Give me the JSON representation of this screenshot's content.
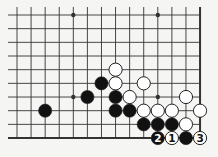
{
  "diagram": {
    "type": "go-board-fragment",
    "grid": {
      "columns": 14,
      "rows": 10,
      "x0": 17,
      "y0": 15,
      "dx": 14.08,
      "dy": 13.67,
      "open_left": true,
      "open_top": true,
      "edge_right": true,
      "edge_bottom": true
    },
    "colors": {
      "background": "#f5f5f3",
      "line": "#333333",
      "black_stone": "#111111",
      "white_stone": "#ffffff",
      "stone_outline": "#222222"
    },
    "star_points": [
      {
        "col": 4,
        "row": 0
      },
      {
        "col": 10,
        "row": 0
      },
      {
        "col": 4,
        "row": 6
      },
      {
        "col": 10,
        "row": 6
      }
    ],
    "stones": [
      {
        "color": "black",
        "col": 2,
        "row": 7,
        "label": ""
      },
      {
        "color": "black",
        "col": 5,
        "row": 6,
        "label": ""
      },
      {
        "color": "black",
        "col": 6,
        "row": 5,
        "label": ""
      },
      {
        "color": "white",
        "col": 7,
        "row": 4,
        "label": ""
      },
      {
        "color": "white",
        "col": 7,
        "row": 5,
        "label": ""
      },
      {
        "color": "white",
        "col": 9,
        "row": 5,
        "label": ""
      },
      {
        "color": "black",
        "col": 7,
        "row": 6,
        "label": ""
      },
      {
        "color": "white",
        "col": 8,
        "row": 6,
        "label": ""
      },
      {
        "color": "white",
        "col": 12,
        "row": 6,
        "label": ""
      },
      {
        "color": "black",
        "col": 7,
        "row": 7,
        "label": ""
      },
      {
        "color": "black",
        "col": 8,
        "row": 7,
        "label": ""
      },
      {
        "color": "white",
        "col": 9,
        "row": 7,
        "label": ""
      },
      {
        "color": "white",
        "col": 10,
        "row": 7,
        "label": ""
      },
      {
        "color": "white",
        "col": 11,
        "row": 7,
        "label": ""
      },
      {
        "color": "white",
        "col": 13,
        "row": 7,
        "label": ""
      },
      {
        "color": "black",
        "col": 9,
        "row": 8,
        "label": ""
      },
      {
        "color": "black",
        "col": 10,
        "row": 8,
        "label": ""
      },
      {
        "color": "black",
        "col": 11,
        "row": 8,
        "label": ""
      },
      {
        "color": "white",
        "col": 12,
        "row": 8,
        "label": ""
      },
      {
        "color": "black",
        "col": 10,
        "row": 9,
        "label": "2"
      },
      {
        "color": "white",
        "col": 11,
        "row": 9,
        "label": "1"
      },
      {
        "color": "black",
        "col": 12,
        "row": 9,
        "label": ""
      },
      {
        "color": "white",
        "col": 13,
        "row": 9,
        "label": "3"
      }
    ]
  }
}
